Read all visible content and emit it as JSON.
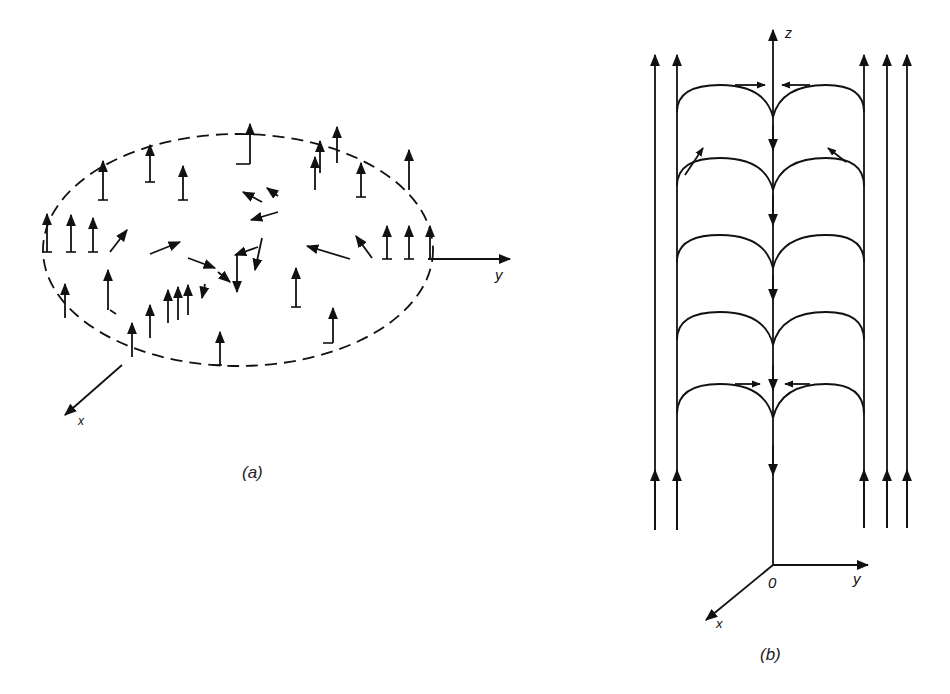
{
  "figure": {
    "panel_a": {
      "caption": "(a)",
      "axis_labels": {
        "x": "x",
        "y": "y"
      },
      "description": "Dashed elliptical contour with vector field arrows (mostly vertical) and tilted arrows converging toward center"
    },
    "panel_b": {
      "caption": "(b)",
      "axis_labels": {
        "x": "x",
        "y": "y",
        "z": "z",
        "origin": "0"
      },
      "description": "Streamlines: vertical upward flow lines on the outer sides, downward flow along central z-axis, with stacked arch-shaped lines connecting them"
    },
    "colors": {
      "ink": "#111111",
      "background": "#ffffff"
    }
  }
}
